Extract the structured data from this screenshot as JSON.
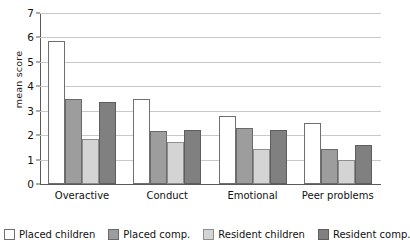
{
  "chart_data": {
    "type": "bar",
    "title": "",
    "xlabel": "",
    "ylabel": "mean score",
    "ylim": [
      0,
      7
    ],
    "ytick_labels": [
      "7",
      "6",
      "5",
      "4",
      "3",
      "2",
      "1",
      "0"
    ],
    "ytick_values": [
      7,
      6,
      5,
      4,
      3,
      2,
      1,
      0
    ],
    "grid": true,
    "legend_position": "bottom",
    "categories": [
      "Overactive",
      "Conduct",
      "Emotional",
      "Peer problems"
    ],
    "series": [
      {
        "name": "Placed children",
        "color": "#ffffff",
        "values": [
          5.85,
          3.5,
          2.8,
          2.5
        ]
      },
      {
        "name": "Placed comp.",
        "color": "#9d9d9d",
        "values": [
          3.5,
          2.15,
          2.3,
          1.45
        ]
      },
      {
        "name": "Resident children",
        "color": "#d4d4d4",
        "values": [
          1.85,
          1.7,
          1.45,
          1.0
        ]
      },
      {
        "name": "Resident comp.",
        "color": "#808080",
        "values": [
          3.35,
          2.2,
          2.2,
          1.6
        ]
      }
    ]
  }
}
